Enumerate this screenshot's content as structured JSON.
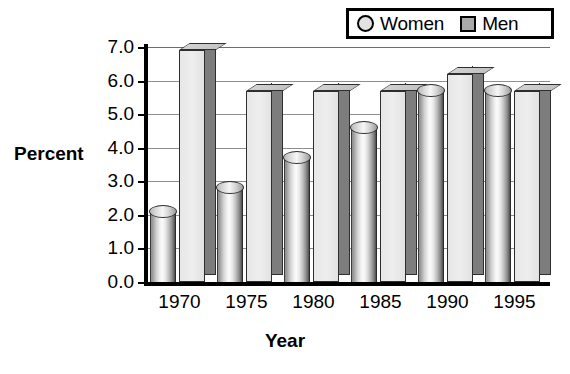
{
  "title_fragment": "g",
  "legend": {
    "position": "top-right",
    "entries": [
      {
        "label": "Women",
        "marker": "circle-marker-icon",
        "color": "#e2e2e2"
      },
      {
        "label": "Men",
        "marker": "square-marker-icon",
        "color": "#a8a8a8"
      }
    ]
  },
  "axes": {
    "ylabel": "Percent",
    "xlabel": "Year",
    "yticks": [
      "0.0",
      "1.0",
      "2.0",
      "3.0",
      "4.0",
      "5.0",
      "6.0",
      "7.0"
    ],
    "xticks": [
      "1970",
      "1975",
      "1980",
      "1985",
      "1990",
      "1995"
    ]
  },
  "chart_data": {
    "type": "bar",
    "title": "",
    "xlabel": "Year",
    "ylabel": "Percent",
    "categories": [
      "1970",
      "1975",
      "1980",
      "1985",
      "1990",
      "1995"
    ],
    "series": [
      {
        "name": "Women",
        "values": [
          2.1,
          2.8,
          3.7,
          4.6,
          5.7,
          5.7
        ],
        "shape": "cylinder",
        "color": "#e8e8e8"
      },
      {
        "name": "Men",
        "values": [
          6.9,
          5.7,
          5.7,
          5.7,
          6.2,
          5.7
        ],
        "shape": "box",
        "color": "#e7e7e7"
      }
    ],
    "ylim": [
      0.0,
      7.0
    ],
    "ytick_step": 1.0,
    "grid": true,
    "legend_position": "top-right",
    "style": "3d"
  }
}
